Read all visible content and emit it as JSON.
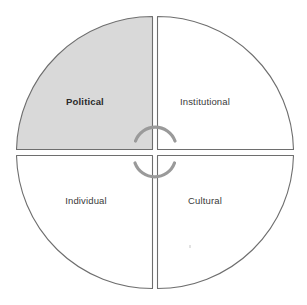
{
  "diagram": {
    "type": "quadrant-circle",
    "shape_label": "divided circle with four wedges",
    "geometry": {
      "center_x": 155,
      "center_y": 152,
      "radius": 138,
      "wedge_gap_px": 5
    },
    "colors": {
      "highlight_fill": "#d9d9d9",
      "plain_fill": "#ffffff",
      "outline": "#6e6e6e",
      "arc": "#9a9a9a",
      "label_text": "#3a3a3a"
    },
    "quadrants": [
      {
        "id": "political",
        "label": "Political",
        "position": "top-left",
        "highlighted": true,
        "emphasis": true
      },
      {
        "id": "institutional",
        "label": "Institutional",
        "position": "top-right",
        "highlighted": false,
        "emphasis": false
      },
      {
        "id": "individual",
        "label": "Individual",
        "position": "bottom-left",
        "highlighted": false,
        "emphasis": false
      },
      {
        "id": "cultural",
        "label": "Cultural",
        "position": "bottom-right",
        "highlighted": false,
        "emphasis": false
      }
    ],
    "center_motif": {
      "name": "broken-circle-arrows",
      "arcs": [
        {
          "id": "upper-arc",
          "opening": "downward"
        },
        {
          "id": "lower-arc",
          "opening": "upward"
        }
      ]
    }
  }
}
